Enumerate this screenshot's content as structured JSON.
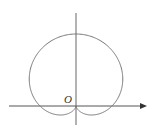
{
  "diagram": {
    "type": "polar-curve",
    "curve": "cardioid r = a(1 + sin θ)",
    "origin_label": "O",
    "colors": {
      "axis": "#555555",
      "curve": "#777777",
      "background": "#ffffff"
    }
  }
}
